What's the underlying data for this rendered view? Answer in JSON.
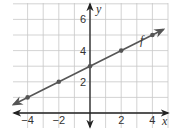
{
  "chart_data": {
    "type": "line",
    "title": "",
    "xlabel": "x",
    "ylabel": "y",
    "xlim": [
      -4.8,
      4.8
    ],
    "ylim": [
      -0.8,
      7.2
    ],
    "grid": true,
    "grid_step": 1,
    "x_ticks": [
      -4,
      -2,
      2,
      4
    ],
    "y_ticks": [
      2,
      4,
      6
    ],
    "x_tick_labels": [
      "−4",
      "−2",
      "2",
      "4"
    ],
    "y_tick_labels": [
      "2",
      "4",
      "6"
    ],
    "series": [
      {
        "name": "f",
        "equation": "y = 0.5x + 3",
        "slope": 0.5,
        "intercept": 3,
        "points": [
          [
            -4,
            1
          ],
          [
            -2,
            2
          ],
          [
            0,
            3
          ],
          [
            2,
            4
          ],
          [
            4,
            5
          ]
        ],
        "color": "#555555",
        "arrows": "both"
      }
    ],
    "annotations": [
      {
        "text": "f",
        "x": 3.2,
        "y": 4.4
      }
    ],
    "colors": {
      "grid": "#c8c8c8",
      "axis": "#222222",
      "line": "#555555"
    }
  }
}
